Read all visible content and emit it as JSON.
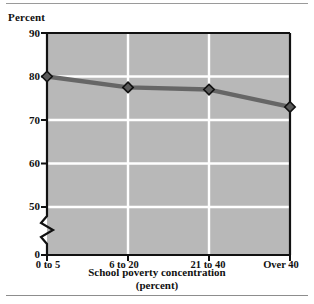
{
  "chart_data": {
    "type": "line",
    "title": "",
    "subtitle": "",
    "xlabel": "School poverty concentration",
    "xlabel_line2": "(percent)",
    "ylabel": "Percent",
    "categories": [
      "0 to 5",
      "6 to 20",
      "21 to 40",
      "Over 40"
    ],
    "values": [
      80,
      77.5,
      77,
      73
    ],
    "series": [
      {
        "name": "Percent",
        "values": [
          80,
          77.5,
          77,
          73
        ]
      }
    ],
    "ylim": [
      0,
      90
    ],
    "yticks": [
      0,
      50,
      60,
      70,
      80,
      90
    ],
    "ytick_labels": [
      "0",
      "50",
      "60",
      "70",
      "80",
      "90"
    ],
    "y_axis_break": true,
    "y_axis_break_between": [
      0,
      50
    ],
    "grid": true,
    "grid_orientation": "both",
    "legend": "none",
    "marker": "diamond",
    "colors": {
      "plot_background": "#b8b8b8",
      "gridline": "#ffffff",
      "line": "#666666",
      "marker_fill": "#5a5a5a",
      "marker_edge": "#111111",
      "axis": "#111111",
      "text": "#111111",
      "rule": "#9a9a9a"
    }
  },
  "labels": {
    "y_unit": "Percent",
    "y_ticks": [
      "90",
      "80",
      "70",
      "60",
      "50",
      "0"
    ],
    "x_ticks": [
      "0 to 5",
      "6 to 20",
      "21 to 40",
      "Over 40"
    ],
    "x_title_line1": "School poverty concentration",
    "x_title_line2": "(percent)"
  }
}
